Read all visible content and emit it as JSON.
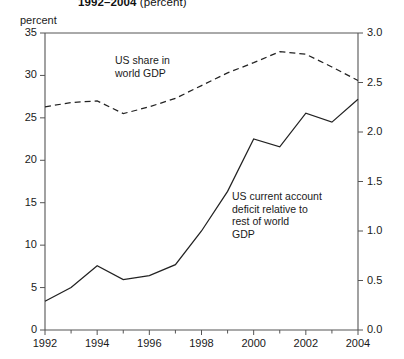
{
  "title": {
    "line": "1992–2004",
    "unit": "(percent)"
  },
  "axis_unit_label": "percent",
  "annotations": {
    "share": "US share in\nworld GDP",
    "deficit": "US current account\ndeficit relative to\nrest of world\nGDP"
  },
  "chart_data": {
    "type": "line",
    "title": "1992–2004 (percent)",
    "xlabel": "",
    "ylabel": "percent",
    "y2label": "percent",
    "xlim": [
      1992,
      2004
    ],
    "ylim": [
      0,
      35
    ],
    "y2lim": [
      0.0,
      3.0
    ],
    "grid": false,
    "legend": "annotations-inline",
    "x": [
      1992,
      1993,
      1994,
      1995,
      1996,
      1997,
      1998,
      1999,
      2000,
      2001,
      2002,
      2003,
      2004
    ],
    "xticks": [
      1992,
      1994,
      1996,
      1998,
      2000,
      2002,
      2004
    ],
    "xticklabels": [
      "1992",
      "1994",
      "1996",
      "1998",
      "2000",
      "2002",
      "2004"
    ],
    "yticks": [
      0,
      5,
      10,
      15,
      20,
      25,
      30,
      35
    ],
    "yticklabels": [
      "0",
      "5",
      "10",
      "15",
      "20",
      "25",
      "30",
      "35"
    ],
    "y2ticks": [
      0.0,
      0.5,
      1.0,
      1.5,
      2.0,
      2.5,
      3.0
    ],
    "y2ticklabels": [
      "0.0",
      "0.5",
      "1.0",
      "1.5",
      "2.0",
      "2.5",
      "3.0"
    ],
    "series": [
      {
        "name": "US share in world GDP",
        "axis": "left",
        "style": "dashed",
        "color": "#222222",
        "values": [
          26.3,
          26.8,
          27.0,
          25.5,
          26.3,
          27.3,
          28.8,
          30.3,
          31.5,
          32.8,
          32.5,
          31.0,
          29.4
        ]
      },
      {
        "name": "US current account deficit relative to rest of world GDP",
        "axis": "right",
        "style": "solid",
        "color": "#222222",
        "values": [
          0.29,
          0.43,
          0.65,
          0.51,
          0.55,
          0.66,
          1.0,
          1.4,
          1.93,
          1.85,
          2.19,
          2.1,
          2.33
        ]
      }
    ]
  }
}
